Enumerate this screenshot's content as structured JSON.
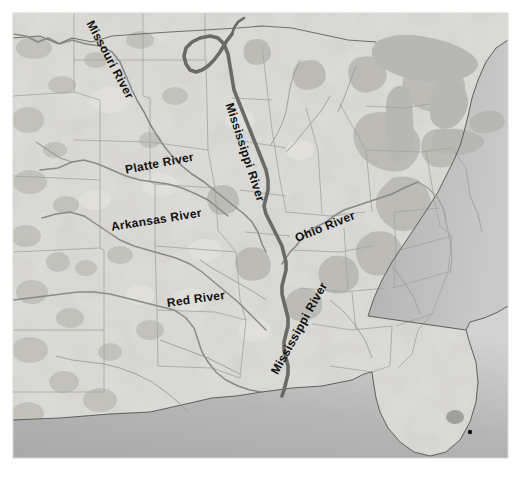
{
  "figure": {
    "caption": "",
    "width": 521,
    "height": 479
  },
  "map": {
    "frame": {
      "x": 13,
      "y": 13,
      "width": 495,
      "height": 445
    },
    "colors": {
      "land": "#cfcfcb",
      "land_light": "#dddcd7",
      "land_shade": "#bdbcb6",
      "ocean_near": "#b4b4b4",
      "ocean_far": "#cfcfcf",
      "lake": "#b9b9b5",
      "state_border": "#9a9a95",
      "country_border": "#7e7e79",
      "coastline": "#6f6f6b",
      "river_main": "#6e6e6a",
      "river_tributary": "#8a8a86",
      "label_text": "#111111",
      "page_background": "#ffffff"
    },
    "labels": [
      {
        "id": "missouri",
        "text": "Missouri River",
        "rotation_deg": 62
      },
      {
        "id": "platte",
        "text": "Platte River",
        "rotation_deg": -11
      },
      {
        "id": "arkansas",
        "text": "Arkansas River",
        "rotation_deg": -9
      },
      {
        "id": "red",
        "text": "Red River",
        "rotation_deg": -8
      },
      {
        "id": "ohio",
        "text": "Ohio River",
        "rotation_deg": -22
      },
      {
        "id": "mississippi_upper",
        "text": "Mississippi River",
        "rotation_deg": 72
      },
      {
        "id": "mississippi_lower",
        "text": "Mississippi River",
        "rotation_deg": -61
      }
    ],
    "features": {
      "highlighted_river": "Mississippi River",
      "tributaries": [
        "Missouri River",
        "Platte River",
        "Arkansas River",
        "Red River",
        "Ohio River"
      ],
      "water_bodies": [
        "Great Lakes",
        "Lake Okeechobee",
        "Gulf of Mexico",
        "Atlantic Ocean"
      ],
      "city_marker_count": 1
    }
  }
}
